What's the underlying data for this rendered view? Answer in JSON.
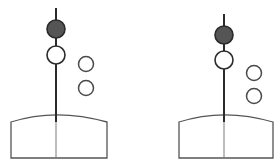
{
  "figure": {
    "title": "",
    "background_color": "#ffffff",
    "width": 280,
    "height": 168,
    "stroke_color": "#2b2b2b",
    "hull_stroke_color": "#555555",
    "filled_shape_color": "#555555",
    "open_shape_color": "#ffffff"
  },
  "panels": [
    {
      "id": "panel-left",
      "label": "",
      "mast": {
        "name": "vertical-mast",
        "x": 56,
        "y_top": 8,
        "y_bottom": 122
      },
      "mast_extension": {
        "name": "mast-extension-through-hull",
        "x": 56,
        "y_top": 114,
        "y_bottom": 158
      },
      "day_shapes": [
        {
          "name": "filled-circle-shape",
          "type": "circle",
          "fill": "filled",
          "cx": 56,
          "cy": 29,
          "r": 9
        },
        {
          "name": "open-circle-shape",
          "type": "circle",
          "fill": "open",
          "cx": 56,
          "cy": 55,
          "r": 9
        }
      ],
      "side_shapes": [
        {
          "name": "open-circle-shape-upper",
          "type": "circle",
          "fill": "open",
          "cx": 86,
          "cy": 64,
          "r": 7.5
        },
        {
          "name": "open-circle-shape-lower",
          "type": "circle",
          "fill": "open",
          "cx": 86,
          "cy": 88,
          "r": 7.5
        }
      ],
      "hull": {
        "name": "vessel-hull",
        "left": 11,
        "right": 107,
        "top": 122,
        "bottom": 158,
        "arch_peak_y": 113,
        "center_x": 56
      }
    },
    {
      "id": "panel-right",
      "label": "",
      "mast": {
        "name": "vertical-mast",
        "x": 224,
        "y_top": 14,
        "y_bottom": 122
      },
      "mast_extension": {
        "name": "mast-extension-through-hull",
        "x": 224,
        "y_top": 114,
        "y_bottom": 158
      },
      "day_shapes": [
        {
          "name": "filled-circle-shape",
          "type": "circle",
          "fill": "filled",
          "cx": 224,
          "cy": 35,
          "r": 9
        },
        {
          "name": "open-circle-shape",
          "type": "circle",
          "fill": "open",
          "cx": 224,
          "cy": 60,
          "r": 9
        }
      ],
      "side_shapes": [
        {
          "name": "open-circle-shape-upper",
          "type": "circle",
          "fill": "open",
          "cx": 254,
          "cy": 73,
          "r": 7.5
        },
        {
          "name": "open-circle-shape-lower",
          "type": "circle",
          "fill": "open",
          "cx": 254,
          "cy": 96,
          "r": 7.5
        }
      ],
      "hull": {
        "name": "vessel-hull",
        "left": 179,
        "right": 273,
        "top": 122,
        "bottom": 158,
        "arch_peak_y": 113,
        "center_x": 224
      }
    }
  ]
}
